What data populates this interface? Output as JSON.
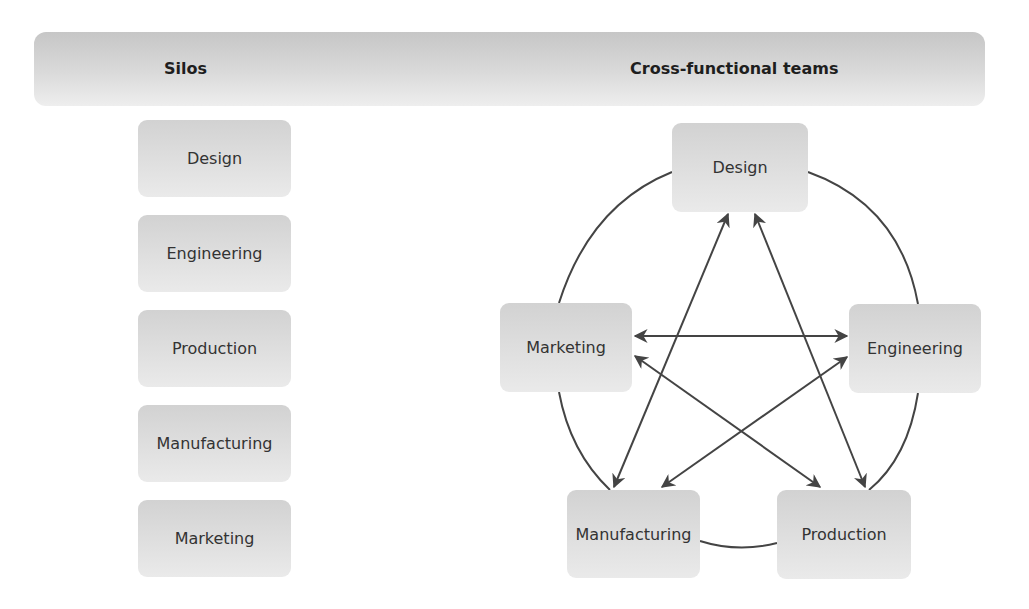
{
  "header": {
    "left_title": "Silos",
    "right_title": "Cross-functional teams"
  },
  "silos": {
    "items": [
      {
        "label": "Design"
      },
      {
        "label": "Engineering"
      },
      {
        "label": "Production"
      },
      {
        "label": "Manufacturing"
      },
      {
        "label": "Marketing"
      }
    ]
  },
  "teams": {
    "nodes": {
      "design": {
        "label": "Design"
      },
      "marketing": {
        "label": "Marketing"
      },
      "engineering": {
        "label": "Engineering"
      },
      "manufacturing": {
        "label": "Manufacturing"
      },
      "production": {
        "label": "Production"
      }
    },
    "ring_connections": [
      [
        "Design",
        "Engineering"
      ],
      [
        "Engineering",
        "Production"
      ],
      [
        "Production",
        "Manufacturing"
      ],
      [
        "Manufacturing",
        "Marketing"
      ],
      [
        "Marketing",
        "Design"
      ]
    ],
    "bidirectional_arrows": [
      [
        "Design",
        "Manufacturing"
      ],
      [
        "Design",
        "Production"
      ],
      [
        "Marketing",
        "Engineering"
      ],
      [
        "Marketing",
        "Production"
      ],
      [
        "Engineering",
        "Manufacturing"
      ]
    ]
  },
  "colors": {
    "line": "#444444",
    "box_top": "#d2d2d2",
    "box_bottom": "#eaeaea"
  }
}
